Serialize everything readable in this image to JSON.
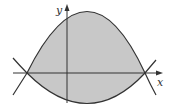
{
  "diagram": {
    "axes": {
      "x_label": "x",
      "y_label": "y"
    },
    "colors": {
      "fill": "#c8c8c8",
      "stroke": "#333333",
      "background": "#ffffff"
    }
  }
}
